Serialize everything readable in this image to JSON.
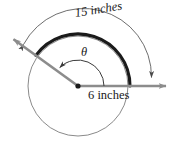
{
  "figure": {
    "kind": "circle-sector-arc-length-diagram",
    "labels": {
      "arc_length": "15 inches",
      "radius": "6 inches",
      "angle": "θ"
    },
    "colors": {
      "ray": "#8c8c8c",
      "thick_arc": "#1a1a1a",
      "thin_circle": "#8a8a8a",
      "dimension_arc": "#6e6e6e",
      "text": "#1a1a1a",
      "background": "#ffffff"
    },
    "geometry": {
      "center_x": 78,
      "center_y": 86,
      "radius_px": 50,
      "thick_arc_radius_px": 52,
      "dimension_arc_radius_px": 68,
      "angle_degrees": 144,
      "theta_arc_radius_px": 26
    },
    "elements": {
      "center_point": "vertex-dot",
      "terminal_ray": "terminal-side-ray",
      "initial_ray": "initial-side-ray",
      "arc": "intercepted-arc",
      "circle": "base-circle",
      "angle_arc": "theta-angle-arc",
      "dimension_arc": "arc-length-dimension"
    }
  }
}
